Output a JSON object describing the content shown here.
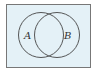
{
  "diagram": {
    "type": "venn",
    "universe": {
      "fill": "#e4f1f7",
      "stroke": "#777777"
    },
    "sets": [
      {
        "label": "A",
        "stroke": "#444444"
      },
      {
        "label": "B",
        "stroke": "#444444"
      }
    ]
  }
}
